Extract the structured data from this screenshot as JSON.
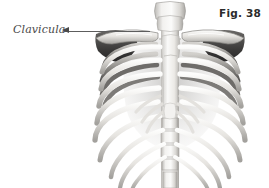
{
  "figure": {
    "caption": "Fig. 38",
    "background_color": "#ffffff"
  },
  "annotations": [
    {
      "label": "Clavicula",
      "target": "clavicle",
      "arrow_direction": "left",
      "label_color": "#4a4a4a",
      "line_color": "#5d5d5d"
    }
  ],
  "illustration": {
    "name": "rib-cage",
    "view": "anterior",
    "parts": [
      "cervical-vertebrae",
      "clavicle-left",
      "clavicle-right",
      "scapula-left",
      "scapula-right",
      "sternum",
      "ribs",
      "costal-cartilage",
      "thoracic-vertebrae",
      "lumbar-vertebrae"
    ],
    "palette": {
      "bone_light": "#f7f6f4",
      "bone_mid": "#d8d6d2",
      "bone_shadow": "#9a9894",
      "bone_dark": "#4d4c4a",
      "deep_shadow": "#2e2d2c"
    }
  }
}
